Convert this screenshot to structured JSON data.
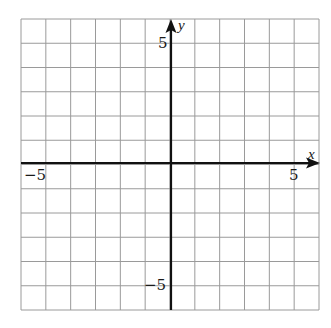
{
  "diagram": {
    "type": "coordinate-grid",
    "x_range": [
      -6,
      6
    ],
    "y_range": [
      -6,
      6
    ],
    "grid_step": 1,
    "axes": {
      "x_label": "x",
      "y_label": "y"
    },
    "tick_labels": {
      "x_neg": "−5",
      "x_pos": "5",
      "y_pos": "5",
      "y_neg": "−5"
    },
    "colors": {
      "grid": "#9a9a9a",
      "axis": "#111111",
      "background": "#ffffff"
    }
  }
}
